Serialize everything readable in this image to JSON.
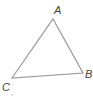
{
  "diagram": {
    "type": "triangle",
    "stroke_color": "#999999",
    "label_color": "#444444",
    "vertices": [
      {
        "name": "A",
        "x": 53,
        "y": 19,
        "label_x": 54,
        "label_y": 14
      },
      {
        "name": "B",
        "x": 83,
        "y": 73,
        "label_x": 85,
        "label_y": 78
      },
      {
        "name": "C",
        "x": 12,
        "y": 78,
        "label_x": 2,
        "label_y": 91
      }
    ],
    "edges": [
      [
        "A",
        "B"
      ],
      [
        "B",
        "C"
      ],
      [
        "C",
        "A"
      ]
    ],
    "labels": {
      "a": "A",
      "b": "B",
      "c": "C"
    },
    "marks": [
      {
        "type": "dot",
        "x": 12,
        "y": 95
      }
    ]
  }
}
